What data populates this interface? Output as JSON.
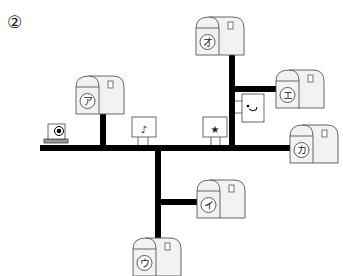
{
  "question_number": "②",
  "mailboxes": [
    {
      "id": "a",
      "label": "ア"
    },
    {
      "id": "i",
      "label": "イ"
    },
    {
      "id": "u",
      "label": "ウ"
    },
    {
      "id": "e",
      "label": "エ"
    },
    {
      "id": "o",
      "label": "オ"
    },
    {
      "id": "ka",
      "label": "カ"
    }
  ],
  "landmarks": [
    {
      "id": "camera",
      "icon": "camera-icon"
    },
    {
      "id": "music",
      "icon": "music-note-icon",
      "symbol": "♪"
    },
    {
      "id": "star",
      "icon": "star-icon",
      "symbol": "★"
    },
    {
      "id": "bath",
      "icon": "bath-icon"
    }
  ],
  "colors": {
    "road": "#000000",
    "mailbox_fill": "#f2f2f2",
    "mailbox_stroke": "#555555",
    "sign_stroke": "#444444"
  }
}
